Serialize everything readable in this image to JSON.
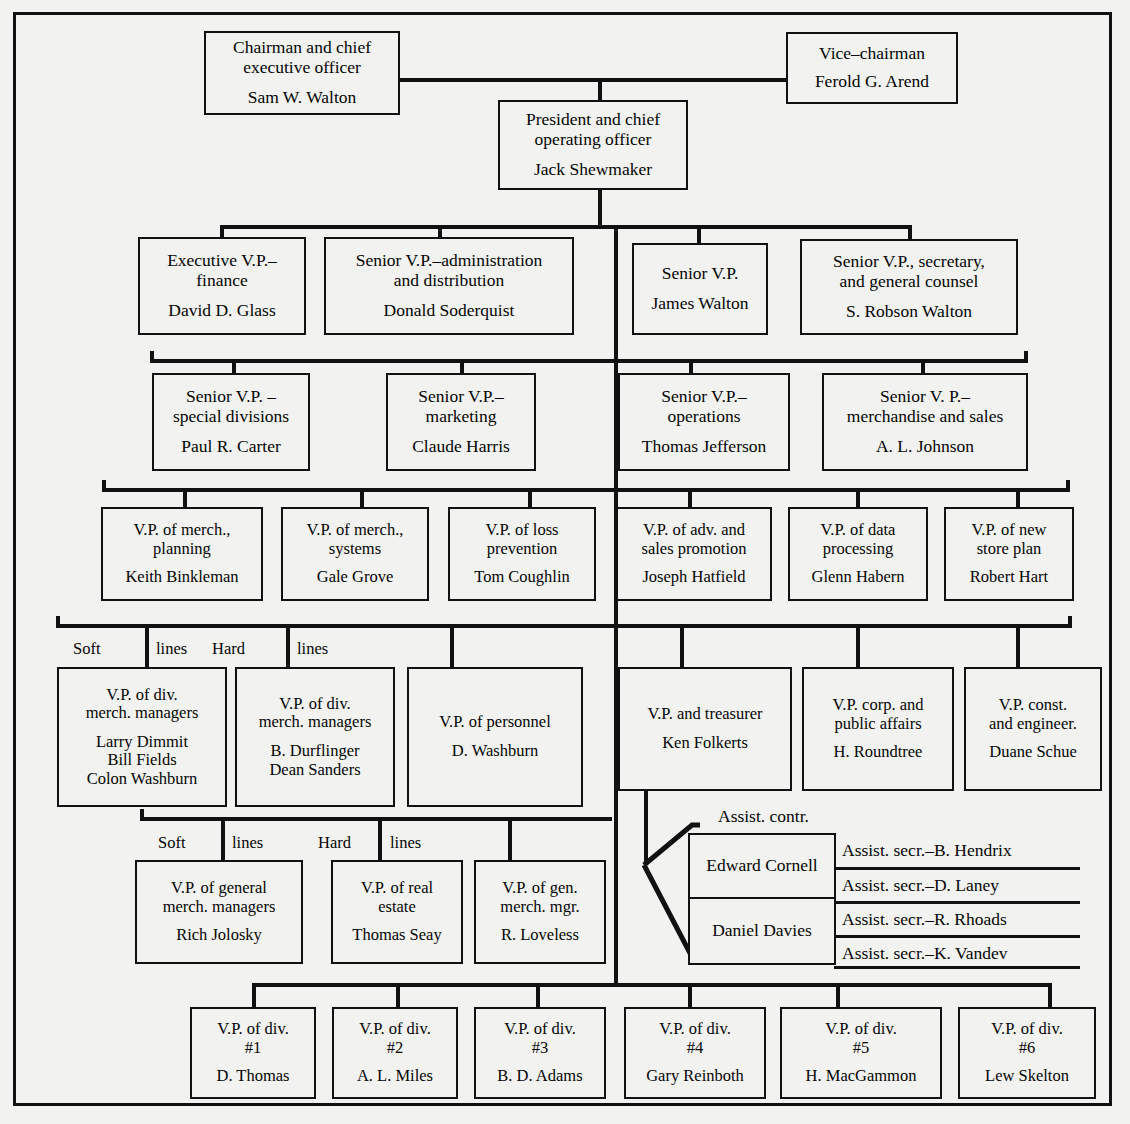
{
  "document": {
    "kind": "organization-chart",
    "subject": "Wal-Mart Stores, Inc. executive organization"
  },
  "nodes": {
    "chairman": {
      "title": "Chairman and chief\nexecutive officer",
      "person": "Sam W. Walton"
    },
    "vice_chairman": {
      "title": "Vice–chairman",
      "person": "Ferold G. Arend"
    },
    "president": {
      "title": "President and chief\noperating officer",
      "person": "Jack Shewmaker"
    },
    "evp_finance": {
      "title": "Executive V.P.–\nfinance",
      "person": "David D. Glass"
    },
    "svp_admin": {
      "title": "Senior V.P.–administration\nand distribution",
      "person": "Donald Soderquist"
    },
    "svp_plain": {
      "title": "Senior V.P.",
      "person": "James Walton"
    },
    "svp_secretary": {
      "title": "Senior V.P., secretary,\nand general counsel",
      "person": "S. Robson Walton"
    },
    "svp_special": {
      "title": "Senior V.P. –\nspecial divisions",
      "person": "Paul R. Carter"
    },
    "svp_marketing": {
      "title": "Senior V.P.–\nmarketing",
      "person": "Claude Harris"
    },
    "svp_operations": {
      "title": "Senior V.P.–\noperations",
      "person": "Thomas Jefferson"
    },
    "svp_merch": {
      "title": "Senior V. P.–\nmerchandise and sales",
      "person": "A. L. Johnson"
    },
    "vp_merch_plan": {
      "title": "V.P. of merch.,\nplanning",
      "person": "Keith Binkleman"
    },
    "vp_merch_sys": {
      "title": "V.P. of merch.,\nsystems",
      "person": "Gale Grove"
    },
    "vp_loss": {
      "title": "V.P. of loss\nprevention",
      "person": "Tom Coughlin"
    },
    "vp_adv": {
      "title": "V.P. of adv. and\nsales promotion",
      "person": "Joseph Hatfield"
    },
    "vp_data": {
      "title": "V.P. of data\nprocessing",
      "person": "Glenn Habern"
    },
    "vp_newstore": {
      "title": "V.P. of new\nstore plan",
      "person": "Robert Hart"
    },
    "vp_div_soft": {
      "title": "V.P. of div.\nmerch. managers",
      "person": "Larry Dimmit\nBill Fields\nColon Washburn"
    },
    "vp_div_hard": {
      "title": "V.P. of div.\nmerch. managers",
      "person": "B. Durflinger\nDean Sanders"
    },
    "vp_personnel": {
      "title": "V.P. of personnel",
      "person": "D. Washburn"
    },
    "vp_treasurer": {
      "title": "V.P. and treasurer",
      "person": "Ken Folkerts"
    },
    "vp_corp": {
      "title": "V.P. corp. and\npublic affairs",
      "person": "H. Roundtree"
    },
    "vp_const": {
      "title": "V.P. const.\nand engineer.",
      "person": "Duane Schue"
    },
    "vp_gen_soft": {
      "title": "V.P. of general\nmerch. managers",
      "person": "Rich Jolosky"
    },
    "vp_realestate": {
      "title": "V.P. of real\nestate",
      "person": "Thomas Seay"
    },
    "vp_gen_mgr": {
      "title": "V.P. of gen.\nmerch. mgr.",
      "person": "R. Loveless"
    },
    "div1": {
      "title": "V.P. of div.\n#1",
      "person": "D. Thomas"
    },
    "div2": {
      "title": "V.P. of div.\n#2",
      "person": "A. L. Miles"
    },
    "div3": {
      "title": "V.P. of div.\n#3",
      "person": "B. D. Adams"
    },
    "div4": {
      "title": "V.P. of div.\n#4",
      "person": "Gary Reinboth"
    },
    "div5": {
      "title": "V.P. of div.\n#5",
      "person": "H. MacGammon"
    },
    "div6": {
      "title": "V.P. of div.\n#6",
      "person": "Lew Skelton"
    }
  },
  "labels": {
    "soft_lines_1_a": "Soft",
    "soft_lines_1_b": "lines",
    "hard_lines_1_a": "Hard",
    "hard_lines_1_b": "lines",
    "soft_lines_2_a": "Soft",
    "soft_lines_2_b": "lines",
    "hard_lines_2_a": "Hard",
    "hard_lines_2_b": "lines",
    "assist_contr": "Assist. contr."
  },
  "controllers": {
    "first": "Edward Cornell",
    "second": "Daniel Davies"
  },
  "assistant_secretaries": [
    "Assist. secr.–B. Hendrix",
    "Assist. secr.–D. Laney",
    "Assist. secr.–R. Rhoads",
    "Assist. secr.–K. Vandev"
  ],
  "colors": {
    "ink": "#111111",
    "paper": "#f2f2f0"
  }
}
